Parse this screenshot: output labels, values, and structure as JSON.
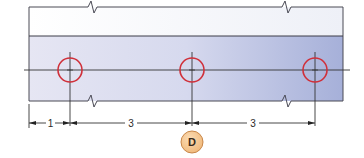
{
  "diagram": {
    "type": "engineering-drawing",
    "colors": {
      "outline": "#4a4a55",
      "plate_left": "#e4e4f2",
      "plate_right": "#a9b2da",
      "upper_band": "#ffffff",
      "hole_circle": "#d0303a",
      "centerline": "#333333",
      "badge_fill": "#f6c68e",
      "badge_stroke": "#c8874a"
    },
    "holes": [
      {
        "id": "hole-1",
        "cx": 70
      },
      {
        "id": "hole-2",
        "cx": 192
      },
      {
        "id": "hole-3",
        "cx": 315
      }
    ],
    "dimensions": [
      {
        "id": "dim-edge-to-hole1",
        "label": "1"
      },
      {
        "id": "dim-hole1-to-hole2",
        "label": "3"
      },
      {
        "id": "dim-hole2-to-hole3",
        "label": "3"
      }
    ],
    "callout": {
      "label": "D"
    }
  }
}
